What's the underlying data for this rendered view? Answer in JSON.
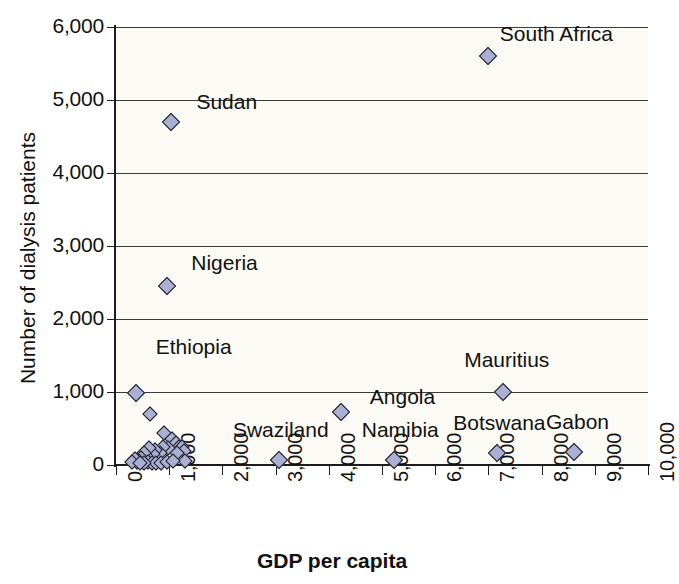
{
  "chart_data": {
    "type": "scatter",
    "title": "",
    "xlabel": "GDP per capita",
    "ylabel": "Number of dialysis patients",
    "xlim": [
      0,
      10000
    ],
    "ylim": [
      0,
      6000
    ],
    "grid": "horizontal",
    "legend": "none",
    "xticks": [
      "0",
      "1,000",
      "2,000",
      "3,000",
      "4,000",
      "5,000",
      "6,000",
      "7,000",
      "8,000",
      "9,000",
      "10,000"
    ],
    "xtick_values": [
      0,
      1000,
      2000,
      3000,
      4000,
      5000,
      6000,
      7000,
      8000,
      9000,
      10000
    ],
    "yticks": [
      "0",
      "1,000",
      "2,000",
      "3,000",
      "4,000",
      "5,000",
      "6,000"
    ],
    "ytick_values": [
      0,
      1000,
      2000,
      3000,
      4000,
      5000,
      6000
    ],
    "marker_color": "#aab0d4",
    "marker_edge_color": "#16161e",
    "plot_bg": "#fbfaf4",
    "labeled_points": [
      {
        "name": "South Africa",
        "x": 7000,
        "y": 5600,
        "label_dx": 68,
        "label_dy": -22
      },
      {
        "name": "Sudan",
        "x": 1030,
        "y": 4700,
        "label_dx": 56,
        "label_dy": -20
      },
      {
        "name": "Nigeria",
        "x": 950,
        "y": 2450,
        "label_dx": 58,
        "label_dy": -23
      },
      {
        "name": "Ethiopia",
        "x": 370,
        "y": 980,
        "label_dx": 58,
        "label_dy": -46
      },
      {
        "name": "Mauritius",
        "x": 7270,
        "y": 1000,
        "label_dx": 4,
        "label_dy": -32
      },
      {
        "name": "Angola",
        "x": 4220,
        "y": 720,
        "label_dx": 62,
        "label_dy": -15
      },
      {
        "name": "Swaziland",
        "x": 3060,
        "y": 70,
        "label_dx": 2,
        "label_dy": -30
      },
      {
        "name": "Namibia",
        "x": 5230,
        "y": 70,
        "label_dx": 6,
        "label_dy": -30
      },
      {
        "name": "Botswana",
        "x": 7170,
        "y": 170,
        "label_dx": 2,
        "label_dy": -30
      },
      {
        "name": "Gabon",
        "x": 8600,
        "y": 180,
        "label_dx": 4,
        "label_dy": -30
      }
    ],
    "unlabeled_points": [
      {
        "x": 640,
        "y": 700
      },
      {
        "x": 900,
        "y": 440
      },
      {
        "x": 1050,
        "y": 360
      },
      {
        "x": 1120,
        "y": 300
      },
      {
        "x": 1180,
        "y": 250
      },
      {
        "x": 1240,
        "y": 240
      },
      {
        "x": 1270,
        "y": 190
      },
      {
        "x": 1150,
        "y": 170
      },
      {
        "x": 1290,
        "y": 60
      },
      {
        "x": 980,
        "y": 230
      },
      {
        "x": 880,
        "y": 240
      },
      {
        "x": 820,
        "y": 170
      },
      {
        "x": 740,
        "y": 210
      },
      {
        "x": 700,
        "y": 150
      },
      {
        "x": 620,
        "y": 230
      },
      {
        "x": 560,
        "y": 120
      },
      {
        "x": 520,
        "y": 170
      },
      {
        "x": 470,
        "y": 90
      },
      {
        "x": 430,
        "y": 60
      },
      {
        "x": 390,
        "y": 40
      },
      {
        "x": 350,
        "y": 80
      },
      {
        "x": 310,
        "y": 40
      },
      {
        "x": 600,
        "y": 40
      },
      {
        "x": 680,
        "y": 30
      },
      {
        "x": 760,
        "y": 30
      },
      {
        "x": 840,
        "y": 25
      },
      {
        "x": 520,
        "y": 30
      },
      {
        "x": 460,
        "y": 25
      },
      {
        "x": 950,
        "y": 40
      },
      {
        "x": 1080,
        "y": 60
      }
    ]
  },
  "axes": {
    "y_title": "Number of dialysis patients",
    "x_title": "GDP per capita"
  }
}
